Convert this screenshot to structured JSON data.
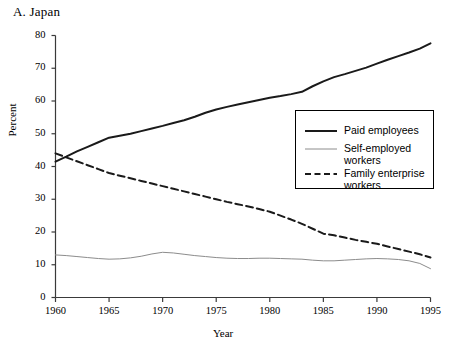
{
  "chart_data": {
    "type": "line",
    "title": "A. Japan",
    "xlabel": "Year",
    "ylabel": "Percent",
    "xlim": [
      1960,
      1995
    ],
    "ylim": [
      0,
      80
    ],
    "yticks": [
      0,
      10,
      20,
      30,
      40,
      50,
      60,
      70,
      80
    ],
    "xticks": [
      1960,
      1965,
      1970,
      1975,
      1980,
      1985,
      1990,
      1995
    ],
    "grid": false,
    "legend_position": "center-right",
    "x": [
      1960,
      1961,
      1962,
      1963,
      1964,
      1965,
      1966,
      1967,
      1968,
      1969,
      1970,
      1971,
      1972,
      1973,
      1974,
      1975,
      1976,
      1977,
      1978,
      1979,
      1980,
      1981,
      1982,
      1983,
      1984,
      1985,
      1986,
      1987,
      1988,
      1989,
      1990,
      1991,
      1992,
      1993,
      1994,
      1995
    ],
    "series": [
      {
        "name": "Paid employees",
        "style": "solid",
        "color": "#1a1a1a",
        "width": 2.0,
        "values": [
          41.5,
          43.0,
          44.6,
          46.0,
          47.4,
          48.8,
          49.4,
          50.0,
          50.8,
          51.6,
          52.4,
          53.3,
          54.1,
          55.2,
          56.4,
          57.4,
          58.2,
          58.9,
          59.6,
          60.3,
          61.0,
          61.5,
          62.1,
          62.8,
          64.5,
          66.0,
          67.3,
          68.2,
          69.2,
          70.2,
          71.4,
          72.6,
          73.7,
          74.8,
          76.0,
          77.6
        ]
      },
      {
        "name": "Self-employed\nworkers",
        "style": "solid",
        "color": "#8c8c8c",
        "width": 1.0,
        "values": [
          13.0,
          12.8,
          12.5,
          12.2,
          11.9,
          11.7,
          11.8,
          12.1,
          12.6,
          13.3,
          13.8,
          13.6,
          13.2,
          12.8,
          12.5,
          12.2,
          12.0,
          11.9,
          11.9,
          12.0,
          12.0,
          11.9,
          11.8,
          11.7,
          11.4,
          11.2,
          11.2,
          11.4,
          11.6,
          11.8,
          11.9,
          11.8,
          11.6,
          11.2,
          10.4,
          8.8
        ]
      },
      {
        "name": "Family enterprise\nworkers",
        "style": "dashed",
        "color": "#1a1a1a",
        "width": 2.0,
        "values": [
          44.0,
          42.8,
          41.6,
          40.4,
          39.2,
          38.0,
          37.2,
          36.4,
          35.6,
          34.8,
          34.0,
          33.2,
          32.4,
          31.6,
          30.8,
          30.0,
          29.2,
          28.5,
          27.8,
          27.0,
          26.2,
          25.0,
          23.8,
          22.5,
          21.0,
          19.5,
          19.0,
          18.3,
          17.6,
          17.0,
          16.4,
          15.6,
          14.8,
          14.0,
          13.2,
          12.2
        ]
      }
    ]
  },
  "legend": {
    "entries": [
      {
        "label": "Paid employees"
      },
      {
        "label": "Self-employed\nworkers"
      },
      {
        "label": "Family enterprise\nworkers"
      }
    ]
  }
}
